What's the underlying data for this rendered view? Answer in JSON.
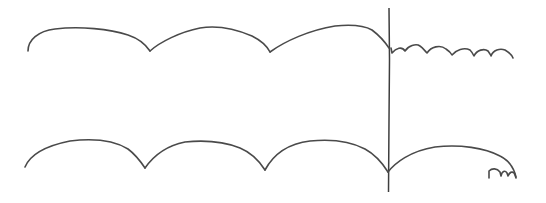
{
  "diagram": {
    "description": "Hand-drawn sketch of two rows of cycloid-like scalloped arcs separated by a vertical line",
    "colors": {
      "background": "#ffffff",
      "ink": "#4a4a4a"
    },
    "vertical_divider": {
      "x": 389,
      "y_top": 8,
      "y_bottom": 192
    },
    "top_row": {
      "large_arcs": 4,
      "cusp_x": [
        150,
        270,
        389
      ],
      "after_divider": "series of ~6 small arcs"
    },
    "bottom_row": {
      "large_arcs": 4,
      "cusp_x": [
        145,
        265,
        388
      ],
      "after_divider": "one large arc ending with a small squiggle"
    }
  }
}
